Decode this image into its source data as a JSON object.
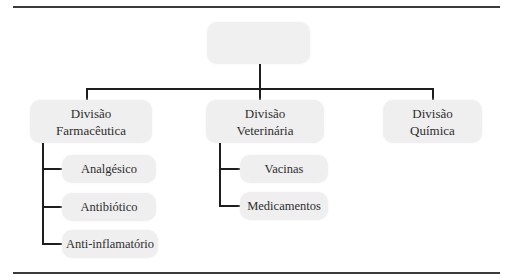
{
  "diagram": {
    "type": "org-chart",
    "root": {
      "label": ""
    },
    "divisions": [
      {
        "label": "Divisão\nFarmacêutica",
        "children": [
          "Analgésico",
          "Antibiótico",
          "Anti-inflamatório"
        ]
      },
      {
        "label": "Divisão\nVeterinária",
        "children": [
          "Vacinas",
          "Medicamentos"
        ]
      },
      {
        "label": "Divisão\nQuímica",
        "children": []
      }
    ]
  },
  "colors": {
    "box_fill": "#efefef",
    "line": "#1e1e1e",
    "rule": "#3a3a3a",
    "text": "#2e2e2e"
  }
}
